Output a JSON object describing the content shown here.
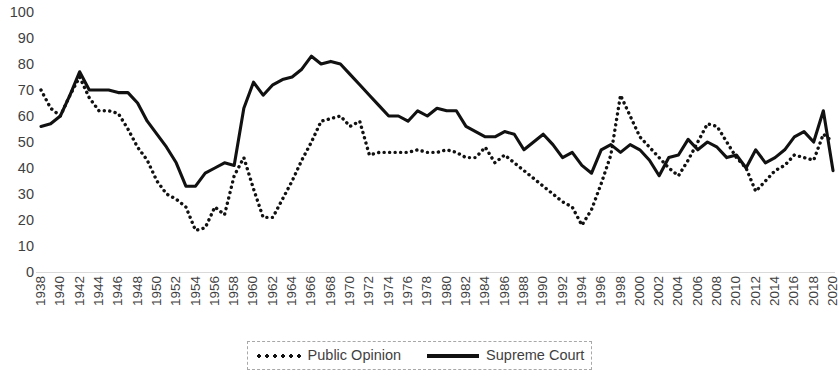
{
  "chart_data": {
    "type": "line",
    "title": "",
    "xlabel": "",
    "ylabel": "",
    "ylim": [
      0,
      100
    ],
    "ytick_step": 10,
    "yticks": [
      100,
      90,
      80,
      70,
      60,
      50,
      40,
      30,
      20,
      10,
      0
    ],
    "grid": false,
    "legend_position": "bottom-center",
    "x_start": 1938,
    "x_end": 2020,
    "xtick_step": 2,
    "xticks": [
      1938,
      1940,
      1942,
      1944,
      1946,
      1948,
      1950,
      1952,
      1954,
      1956,
      1958,
      1960,
      1962,
      1964,
      1966,
      1968,
      1970,
      1972,
      1974,
      1976,
      1978,
      1980,
      1982,
      1984,
      1986,
      1988,
      1990,
      1992,
      1994,
      1996,
      1998,
      2000,
      2002,
      2004,
      2006,
      2008,
      2010,
      2012,
      2014,
      2016,
      2018,
      2020
    ],
    "x": [
      1938,
      1939,
      1940,
      1941,
      1942,
      1943,
      1944,
      1945,
      1946,
      1947,
      1948,
      1949,
      1950,
      1951,
      1952,
      1953,
      1954,
      1955,
      1956,
      1957,
      1958,
      1959,
      1960,
      1961,
      1962,
      1963,
      1964,
      1965,
      1966,
      1967,
      1968,
      1969,
      1970,
      1971,
      1972,
      1973,
      1974,
      1975,
      1976,
      1977,
      1978,
      1979,
      1980,
      1981,
      1982,
      1983,
      1984,
      1985,
      1986,
      1987,
      1988,
      1989,
      1990,
      1991,
      1992,
      1993,
      1994,
      1995,
      1996,
      1997,
      1998,
      1999,
      2000,
      2001,
      2002,
      2003,
      2004,
      2005,
      2006,
      2007,
      2008,
      2009,
      2010,
      2011,
      2012,
      2013,
      2014,
      2015,
      2016,
      2017,
      2018,
      2019,
      2020
    ],
    "series": [
      {
        "name": "Public Opinion",
        "style": "dotted",
        "color": "#111111",
        "values": [
          70,
          63,
          60,
          68,
          75,
          67,
          62,
          62,
          61,
          55,
          48,
          43,
          35,
          30,
          28,
          25,
          16,
          17,
          25,
          22,
          37,
          44,
          32,
          21,
          21,
          28,
          35,
          43,
          50,
          58,
          59,
          60,
          56,
          58,
          45,
          46,
          46,
          46,
          46,
          47,
          46,
          46,
          47,
          46,
          44,
          44,
          48,
          42,
          45,
          42,
          39,
          36,
          33,
          30,
          27,
          25,
          18,
          24,
          34,
          45,
          68,
          60,
          52,
          48,
          44,
          40,
          37,
          43,
          50,
          57,
          56,
          50,
          44,
          40,
          31,
          35,
          39,
          41,
          45,
          44,
          43,
          53,
          50
        ]
      },
      {
        "name": "Supreme Court",
        "style": "solid",
        "color": "#111111",
        "values": [
          56,
          57,
          60,
          68,
          77,
          70,
          70,
          70,
          69,
          69,
          65,
          58,
          53,
          48,
          42,
          33,
          33,
          38,
          40,
          42,
          41,
          63,
          73,
          68,
          72,
          74,
          75,
          78,
          83,
          80,
          81,
          80,
          76,
          72,
          68,
          64,
          60,
          60,
          58,
          62,
          60,
          63,
          62,
          62,
          56,
          54,
          52,
          52,
          54,
          53,
          47,
          50,
          53,
          49,
          44,
          46,
          41,
          38,
          47,
          49,
          46,
          49,
          47,
          43,
          37,
          44,
          45,
          51,
          47,
          50,
          48,
          44,
          45,
          40,
          47,
          42,
          44,
          47,
          52,
          54,
          50,
          62,
          39
        ]
      }
    ]
  },
  "legend": {
    "items": [
      {
        "label": "Public Opinion",
        "style": "dotted"
      },
      {
        "label": "Supreme Court",
        "style": "solid"
      }
    ]
  }
}
